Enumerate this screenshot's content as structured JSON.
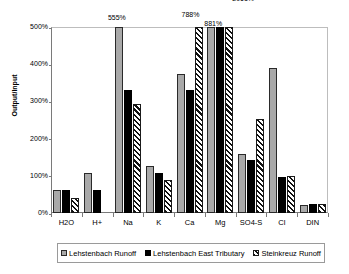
{
  "chart_data": {
    "type": "bar",
    "title": "",
    "xlabel": "",
    "ylabel": "Output/Input",
    "ylim": [
      0,
      500
    ],
    "ytick_labels": [
      "0%",
      "100%",
      "200%",
      "300%",
      "400%",
      "500%"
    ],
    "ytick_values": [
      0,
      100,
      200,
      300,
      400,
      500
    ],
    "grid": false,
    "legend_position": "bottom",
    "units": "percent",
    "categories": [
      "H2O",
      "H+",
      "Na",
      "K",
      "Ca",
      "Mg",
      "SO4-S",
      "Cl",
      "DIN"
    ],
    "series": [
      {
        "name": "Lehstenbach Runoff",
        "style": "gray-fill",
        "color": "#a9a9a9",
        "values": [
          63,
          108,
          555,
          127,
          374,
          881,
          159,
          389,
          22
        ]
      },
      {
        "name": "Lehstenbach East Tributary",
        "style": "black-fill",
        "color": "#000000",
        "values": [
          63,
          62,
          330,
          108,
          330,
          881,
          142,
          96,
          24
        ]
      },
      {
        "name": "Steinkreuz Runoff",
        "style": "diagonal-hatch",
        "color": "#ffffff",
        "values": [
          41,
          null,
          292,
          90,
          788,
          2061,
          254,
          99,
          24
        ]
      }
    ],
    "overflow_labels": [
      {
        "text": "555%",
        "category": "Na",
        "series": "Lehstenbach Runoff",
        "value": 555
      },
      {
        "text": "788%",
        "category": "Ca",
        "series": "Steinkreuz Runoff",
        "value": 788
      },
      {
        "text": "881%",
        "category": "Mg",
        "series": "Lehstenbach Runoff",
        "value": 881
      },
      {
        "text": "2061%",
        "category": "Mg",
        "series": "Steinkreuz Runoff",
        "value": 2061
      }
    ]
  },
  "legend": {
    "items": [
      {
        "label": "Lehstenbach Runoff"
      },
      {
        "label": "Lehstenbach East Tributary"
      },
      {
        "label": "Steinkreuz Runoff"
      }
    ]
  }
}
